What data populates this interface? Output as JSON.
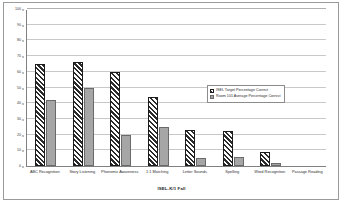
{
  "chart_data": {
    "type": "bar",
    "title": "",
    "xlabel": "ISEL-K/1 Fall",
    "ylabel": "",
    "ylim": [
      0,
      100
    ],
    "yticks": [
      0,
      10,
      20,
      30,
      40,
      50,
      60,
      70,
      80,
      90,
      100
    ],
    "grid": true,
    "legend_position": "right-middle",
    "categories": [
      "ABC Recognition",
      "Story Listening",
      "Phonemic Awareness",
      "1:1 Matching",
      "Letter Sounds",
      "Spelling",
      "Word Recognition",
      "Passage Reading"
    ],
    "series": [
      {
        "name": "ISEL Target Percentage Correct",
        "color": "#2b2b2b",
        "pattern": "diagonal-hatch",
        "values": [
          65,
          66,
          60,
          44,
          23,
          22,
          9,
          0
        ]
      },
      {
        "name": "Room 101 Average Percentage Correct",
        "color": "#a6a6a6",
        "pattern": "solid",
        "values": [
          42,
          50,
          20,
          25,
          5,
          6,
          2,
          0
        ]
      }
    ]
  },
  "axis": {
    "x_title": "ISEL-K/1 Fall"
  }
}
